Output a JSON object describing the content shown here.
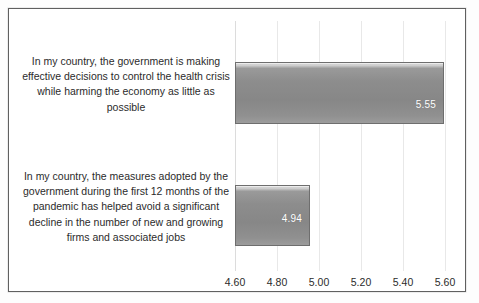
{
  "chart_data": {
    "type": "bar",
    "orientation": "horizontal",
    "title": "",
    "xlabel": "",
    "ylabel": "",
    "categories": [
      "In my country, the government is making effective decisions to control the health crisis while harming the economy as little as possible",
      "In my country, the measures adopted by the government during the first 12 months of the pandemic has helped avoid a significant decline in the number of new and growing firms and associated jobs"
    ],
    "values": [
      5.55,
      4.94
    ],
    "data_labels": [
      "5.55",
      "4.94"
    ],
    "xlim": [
      4.6,
      5.6
    ],
    "xticks": [
      4.6,
      4.8,
      5.0,
      5.2,
      5.4,
      5.6
    ],
    "xtick_labels": [
      "4.60",
      "4.80",
      "5.00",
      "5.20",
      "5.40",
      "5.60"
    ],
    "grid": true,
    "grid_axis": "x",
    "legend": false,
    "legend_position": "none",
    "colors": {
      "bar_fill_top": "#d6d6d6",
      "bar_fill_body": "#8d8d8d",
      "bar_outline": "#6e6e6e",
      "data_label_text": "#ffffff",
      "category_text": "#2b2b2b",
      "tick_text": "#2b2b2b",
      "gridline": "#e8e8e8",
      "frame_border": "#5f5f5f",
      "background": "#ffffff"
    }
  }
}
